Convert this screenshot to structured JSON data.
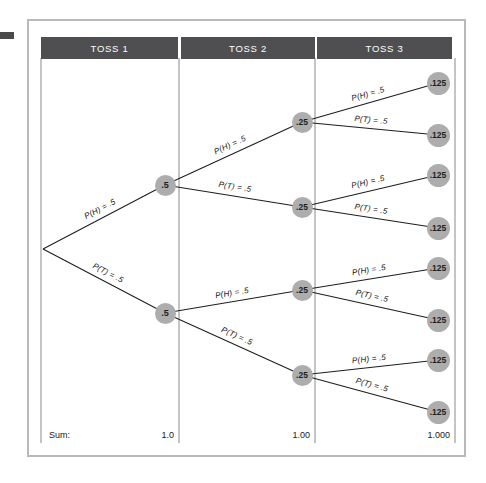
{
  "figure": {
    "colors": {
      "header_bar": "#4f4f51",
      "node_fill": "#adadad",
      "frame_border": "#b9b9bc",
      "divider": "#8a8a8a",
      "edge_line": "#1e1e1e",
      "background": "#ffffff"
    }
  },
  "columns": [
    {
      "id": "toss1",
      "label": "TOSS 1",
      "sum": "1.0"
    },
    {
      "id": "toss2",
      "label": "TOSS 2",
      "sum": "1.00"
    },
    {
      "id": "toss3",
      "label": "TOSS 3",
      "sum": "1.000"
    }
  ],
  "sum_row": {
    "label": "Sum:"
  },
  "chart_data": {
    "type": "diagram",
    "subtype": "probability-tree",
    "stages": [
      "TOSS 1",
      "TOSS 2",
      "TOSS 3"
    ],
    "branch_labels": {
      "heads": "P(H) = .5",
      "tails": "P(T) = .5"
    },
    "branch_probability": 0.5,
    "root": {
      "x": 43,
      "y": 249
    },
    "level1_nodes": [
      {
        "id": "H",
        "value": ".5",
        "x": 165,
        "y": 185
      },
      {
        "id": "T",
        "value": ".5",
        "x": 165,
        "y": 313
      }
    ],
    "level2_nodes": [
      {
        "id": "HH",
        "value": ".25",
        "x": 302,
        "y": 122
      },
      {
        "id": "HT",
        "value": ".25",
        "x": 302,
        "y": 207
      },
      {
        "id": "TH",
        "value": ".25",
        "x": 302,
        "y": 290
      },
      {
        "id": "TT",
        "value": ".25",
        "x": 302,
        "y": 375
      }
    ],
    "level3_nodes": [
      {
        "id": "HHH",
        "value": ".125",
        "x": 438,
        "y": 83
      },
      {
        "id": "HHT",
        "value": ".125",
        "x": 438,
        "y": 135
      },
      {
        "id": "HTH",
        "value": ".125",
        "x": 438,
        "y": 175
      },
      {
        "id": "HTT",
        "value": ".125",
        "x": 438,
        "y": 228
      },
      {
        "id": "THH",
        "value": ".125",
        "x": 438,
        "y": 268
      },
      {
        "id": "THT",
        "value": ".125",
        "x": 438,
        "y": 320
      },
      {
        "id": "TTH",
        "value": ".125",
        "x": 438,
        "y": 360
      },
      {
        "id": "TTT",
        "value": ".125",
        "x": 438,
        "y": 412
      }
    ],
    "edges": [
      {
        "from": "root",
        "to": "H",
        "label": "P(H) = .5",
        "x1": 43,
        "y1": 249,
        "x2": 165,
        "y2": 185
      },
      {
        "from": "root",
        "to": "T",
        "label": "P(T) = .5",
        "x1": 43,
        "y1": 249,
        "x2": 165,
        "y2": 313
      },
      {
        "from": "H",
        "to": "HH",
        "label": "P(H) = .5",
        "x1": 165,
        "y1": 185,
        "x2": 302,
        "y2": 122
      },
      {
        "from": "H",
        "to": "HT",
        "label": "P(T) = .5",
        "x1": 165,
        "y1": 185,
        "x2": 302,
        "y2": 207
      },
      {
        "from": "T",
        "to": "TH",
        "label": "P(H) = .5",
        "x1": 165,
        "y1": 313,
        "x2": 302,
        "y2": 290
      },
      {
        "from": "T",
        "to": "TT",
        "label": "P(T) = .5",
        "x1": 165,
        "y1": 313,
        "x2": 302,
        "y2": 375
      },
      {
        "from": "HH",
        "to": "HHH",
        "label": "P(H) = .5",
        "x1": 302,
        "y1": 122,
        "x2": 438,
        "y2": 83
      },
      {
        "from": "HH",
        "to": "HHT",
        "label": "P(T) = .5",
        "x1": 302,
        "y1": 122,
        "x2": 438,
        "y2": 135
      },
      {
        "from": "HT",
        "to": "HTH",
        "label": "P(H) = .5",
        "x1": 302,
        "y1": 207,
        "x2": 438,
        "y2": 175
      },
      {
        "from": "HT",
        "to": "HTT",
        "label": "P(T) = .5",
        "x1": 302,
        "y1": 207,
        "x2": 438,
        "y2": 228
      },
      {
        "from": "TH",
        "to": "THH",
        "label": "P(H) = .5",
        "x1": 302,
        "y1": 290,
        "x2": 438,
        "y2": 268
      },
      {
        "from": "TH",
        "to": "THT",
        "label": "P(T) = .5",
        "x1": 302,
        "y1": 290,
        "x2": 438,
        "y2": 320
      },
      {
        "from": "TT",
        "to": "TTH",
        "label": "P(H) = .5",
        "x1": 302,
        "y1": 375,
        "x2": 438,
        "y2": 360
      },
      {
        "from": "TT",
        "to": "TTT",
        "label": "P(T) = .5",
        "x1": 302,
        "y1": 375,
        "x2": 438,
        "y2": 412
      }
    ],
    "dividers_x": [
      41,
      179,
      315,
      455
    ],
    "divider_y_range": [
      58,
      443
    ],
    "column_sums": [
      "1.0",
      "1.00",
      "1.000"
    ]
  }
}
